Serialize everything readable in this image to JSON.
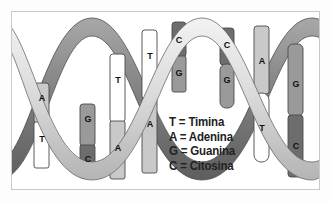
{
  "figure": {
    "title_visible": false,
    "frame_border_color": "#c9c9c9",
    "background_color": "#ffffff"
  },
  "legend": {
    "rows": [
      {
        "code": "T",
        "eq": "=",
        "name": "Timina",
        "text": "T = Timina"
      },
      {
        "code": "A",
        "eq": "=",
        "name": "Adenina",
        "text": "A = Adenina"
      },
      {
        "code": "G",
        "eq": "=",
        "name": "Guanina",
        "text": "G = Guanina"
      },
      {
        "code": "C",
        "eq": "=",
        "name": "Citosina",
        "text": "C = Citosina"
      }
    ]
  },
  "palette": {
    "adenine": "#c9c9c9",
    "thymine": "#ffffff",
    "guanine": "#9a9a9a",
    "cytosine": "#6d6d6d",
    "rung_outline": "#4a4a4a",
    "ribbon_light": "#d8d8d8",
    "ribbon_dark": "#8a8a8a",
    "ribbon_outline": "#5a5a5a",
    "text": "#1a1a1a"
  },
  "base_pairs": [
    {
      "id": "bp-1",
      "x": 28,
      "top_base": "A",
      "bottom_base": "T",
      "top_label": "A",
      "bottom_label": "T"
    },
    {
      "id": "bp-2",
      "x": 74,
      "top_base": "G",
      "bottom_base": "C",
      "top_label": "G",
      "bottom_label": "C"
    },
    {
      "id": "bp-3",
      "x": 104,
      "top_base": "T",
      "bottom_base": "A",
      "top_label": "T",
      "bottom_label": "A"
    },
    {
      "id": "bp-4",
      "x": 136,
      "top_base": "T",
      "bottom_base": "A",
      "top_label": "T",
      "bottom_label": "A"
    },
    {
      "id": "bp-5",
      "x": 166,
      "top_base": "C",
      "bottom_base": "G",
      "top_label": "C",
      "bottom_label": "G"
    },
    {
      "id": "bp-6",
      "x": 214,
      "top_base": "C",
      "bottom_base": "G",
      "top_label": "C",
      "bottom_label": "G"
    },
    {
      "id": "bp-7",
      "x": 248,
      "top_base": "A",
      "bottom_base": "T",
      "top_label": "A",
      "bottom_label": "T"
    },
    {
      "id": "bp-8",
      "x": 282,
      "top_base": "G",
      "bottom_base": "C",
      "top_label": "G",
      "bottom_label": "C"
    }
  ],
  "base_letters": [
    {
      "id": "letter-1",
      "char": "A",
      "x": 29,
      "y": 86
    },
    {
      "id": "letter-2",
      "char": "T",
      "x": 29,
      "y": 125
    },
    {
      "id": "letter-3",
      "char": "G",
      "x": 75,
      "y": 108
    },
    {
      "id": "letter-4",
      "char": "C",
      "x": 75,
      "y": 147
    },
    {
      "id": "letter-5",
      "char": "T",
      "x": 105,
      "y": 68
    },
    {
      "id": "letter-6",
      "char": "A",
      "x": 105,
      "y": 136
    },
    {
      "id": "letter-7",
      "char": "T",
      "x": 137,
      "y": 44
    },
    {
      "id": "letter-8",
      "char": "A",
      "x": 137,
      "y": 112
    },
    {
      "id": "letter-9",
      "char": "C",
      "x": 167,
      "y": 35
    },
    {
      "id": "letter-10",
      "char": "G",
      "x": 167,
      "y": 64
    },
    {
      "id": "letter-11",
      "char": "C",
      "x": 215,
      "y": 37
    },
    {
      "id": "letter-12",
      "char": "G",
      "x": 215,
      "y": 72
    },
    {
      "id": "letter-13",
      "char": "A",
      "x": 249,
      "y": 52
    },
    {
      "id": "letter-14",
      "char": "T",
      "x": 249,
      "y": 117
    },
    {
      "id": "letter-15",
      "char": "G",
      "x": 283,
      "y": 74
    },
    {
      "id": "letter-16",
      "char": "C",
      "x": 283,
      "y": 136
    }
  ]
}
